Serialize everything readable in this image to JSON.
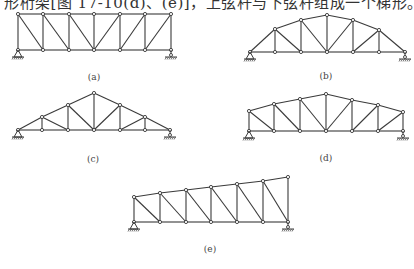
{
  "caption": "形桁架[图 17-10(d)、(e)]，上弦杆与下弦杆组成一个梯形。",
  "style": {
    "line_color": "#3a3a3a",
    "node_fill": "#ffffff"
  },
  "trusses": [
    {
      "id": "a",
      "label": "(a)",
      "label_pos": [
        94,
        80
      ],
      "bottom": [
        [
          18,
          50
        ],
        [
          43,
          50
        ],
        [
          69,
          50
        ],
        [
          94,
          50
        ],
        [
          120,
          50
        ],
        [
          145,
          50
        ],
        [
          171,
          50
        ]
      ],
      "top": [
        [
          18,
          14
        ],
        [
          43,
          14
        ],
        [
          69,
          14
        ],
        [
          94,
          14
        ],
        [
          120,
          14
        ],
        [
          145,
          14
        ],
        [
          171,
          14
        ]
      ],
      "diagonals": [
        [
          0,
          1
        ],
        [
          1,
          2
        ],
        [
          2,
          3
        ],
        [
          4,
          3
        ],
        [
          5,
          4
        ],
        [
          6,
          5
        ]
      ],
      "diag_dir": "top-to-bottom"
    },
    {
      "id": "b",
      "label": "(b)",
      "label_pos": [
        326,
        79
      ],
      "bottom": [
        [
          250,
          52
        ],
        [
          275,
          52
        ],
        [
          301,
          52
        ],
        [
          327,
          52
        ],
        [
          353,
          52
        ],
        [
          379,
          52
        ],
        [
          405,
          52
        ]
      ],
      "top": [
        null,
        [
          275,
          29
        ],
        [
          301,
          20
        ],
        [
          327,
          15
        ],
        [
          353,
          20
        ],
        [
          379,
          30
        ],
        null
      ]
    },
    {
      "id": "c",
      "label": "(c)",
      "label_pos": [
        93,
        162
      ],
      "bottom": [
        [
          18,
          130
        ],
        [
          42,
          130
        ],
        [
          68,
          130
        ],
        [
          94,
          130
        ],
        [
          120,
          130
        ],
        [
          145,
          130
        ],
        [
          170,
          130
        ]
      ],
      "top": [
        null,
        [
          42,
          117
        ],
        [
          68,
          105
        ],
        [
          94,
          93
        ],
        [
          120,
          105
        ],
        [
          145,
          117
        ],
        null
      ]
    },
    {
      "id": "d",
      "label": "(d)",
      "label_pos": [
        326,
        161
      ],
      "bottom": [
        [
          249,
          131
        ],
        [
          274,
          131
        ],
        [
          300,
          131
        ],
        [
          326,
          131
        ],
        [
          352,
          131
        ],
        [
          378,
          131
        ],
        [
          403,
          131
        ]
      ],
      "top": [
        [
          249,
          111
        ],
        [
          274,
          104
        ],
        [
          300,
          99
        ],
        [
          326,
          94
        ],
        [
          352,
          100
        ],
        [
          378,
          105
        ],
        [
          403,
          112
        ]
      ]
    },
    {
      "id": "e",
      "label": "(e)",
      "label_pos": [
        210,
        252
      ],
      "bottom": [
        [
          134,
          222
        ],
        [
          160,
          222
        ],
        [
          186,
          222
        ],
        [
          211,
          222
        ],
        [
          237,
          222
        ],
        [
          263,
          222
        ],
        [
          288,
          222
        ]
      ],
      "top": [
        [
          134,
          197
        ],
        [
          160,
          193
        ],
        [
          186,
          190
        ],
        [
          211,
          187
        ],
        [
          237,
          184
        ],
        [
          263,
          181
        ],
        [
          288,
          177
        ]
      ]
    }
  ]
}
